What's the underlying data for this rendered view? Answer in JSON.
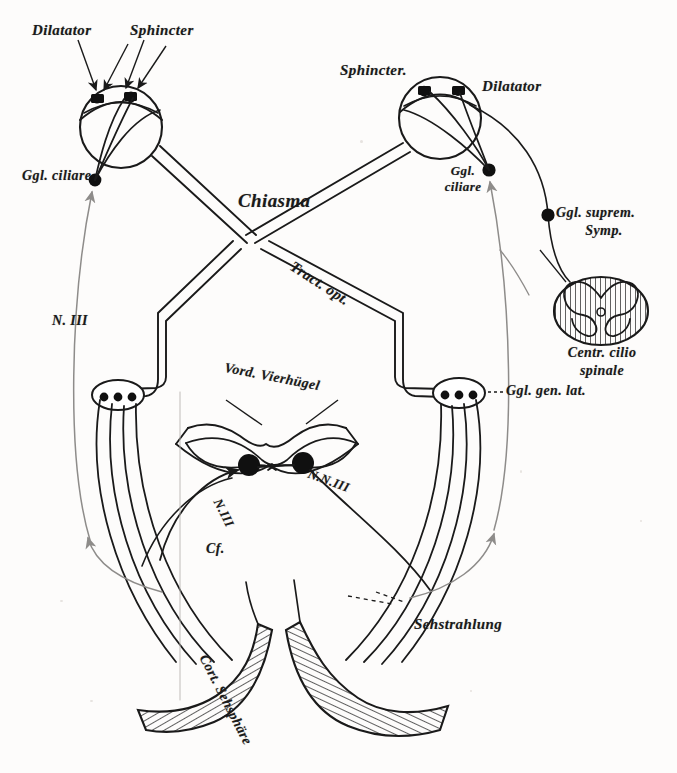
{
  "figure": {
    "domain": "anatomical-diagram",
    "background_color": "#fdfcfb",
    "ink_color": "#1a1a1a",
    "accent_gray": "#8e8c8a"
  },
  "labels": {
    "dilatator_left": "Dilatator",
    "sphincter_left": "Sphincter",
    "ggl_ciliare_left": "Ggl. ciliare",
    "sphincter_right": "Sphincter.",
    "dilatator_right": "Dilatator",
    "ggl_ciliare_right_l1": "Ggl.",
    "ggl_ciliare_right_l2": "ciliare",
    "ggl_suprem_l1": "Ggl. suprem.",
    "ggl_suprem_l2": "Symp.",
    "centr_cilio_l1": "Centr. cilio",
    "centr_cilio_l2": "spinale",
    "chiasma": "Chiasma",
    "tract_opt": "Tract. opt.",
    "n_iii_left": "N. III",
    "vord_vierhugel": "Vord. Vierhügel",
    "ggl_gen_lat": "Ggl. gen. lat.",
    "nn_iii": "N.N.III",
    "n_iii_mid": "N.III",
    "cf": "Cf.",
    "sehstrahlung": "Sehstrahlung",
    "cort_sehsphare": "Cort. Sehsphäre"
  },
  "structures": {
    "eye_left": "left-eye",
    "eye_right": "right-eye",
    "spinal_cord": "spinal-cord-cross-section",
    "geniculate_left": "left-lateral-geniculate-nucleus",
    "geniculate_right": "right-lateral-geniculate-nucleus",
    "colliculus": "superior-colliculus",
    "cortex": "visual-cortex"
  }
}
